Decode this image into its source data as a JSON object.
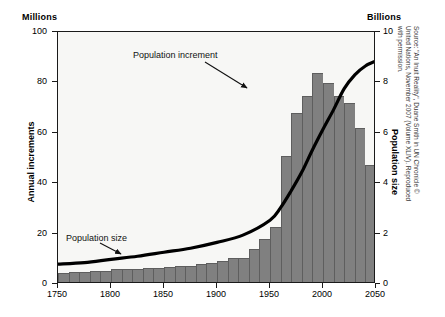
{
  "chart_data": {
    "type": "bar",
    "title": "",
    "subtitle": "",
    "xlabel": "",
    "ylabel": "Annual increments",
    "y2label": "Population size",
    "left_unit_caption": "Millions",
    "right_unit_caption": "Billions",
    "grid": false,
    "legend_position": "none",
    "xlim": [
      1750,
      2050
    ],
    "ylim": [
      0,
      100
    ],
    "y2lim": [
      0,
      10
    ],
    "xticks": [
      1750,
      1800,
      1850,
      1900,
      1950,
      2000,
      2050
    ],
    "xtick_labels": [
      "1750",
      "1800",
      "1850",
      "1900",
      "1950",
      "2000",
      "2050"
    ],
    "yticks": [
      0,
      20,
      40,
      60,
      80,
      100
    ],
    "ytick_labels": [
      "0",
      "20",
      "40",
      "60",
      "80",
      "100"
    ],
    "y2ticks": [
      0,
      2,
      4,
      6,
      8,
      10
    ],
    "y2tick_labels": [
      "0",
      "2",
      "4",
      "6",
      "8",
      "10"
    ],
    "bar_color": "#808080",
    "line_color": "#000000",
    "plot_background": "#f7f7f5",
    "bin_width_years": 10,
    "series": [
      {
        "name": "Population increment",
        "type": "bar",
        "axis": "left",
        "unit": "Millions",
        "x": [
          1750,
          1760,
          1770,
          1780,
          1790,
          1800,
          1810,
          1820,
          1830,
          1840,
          1850,
          1860,
          1870,
          1880,
          1890,
          1900,
          1910,
          1920,
          1930,
          1940,
          1950,
          1960,
          1970,
          1980,
          1990,
          2000,
          2010,
          2020,
          2030,
          2040
        ],
        "values": [
          3.5,
          4.0,
          4.0,
          4.2,
          4.5,
          5.0,
          5.0,
          5.2,
          5.5,
          5.5,
          6.0,
          6.2,
          6.5,
          7.0,
          7.5,
          8.5,
          9.5,
          9.5,
          13.0,
          17.0,
          22.0,
          50.0,
          67.0,
          74.0,
          83.0,
          79.0,
          74.0,
          71.0,
          61.0,
          46.5
        ]
      },
      {
        "name": "Population size",
        "type": "line",
        "axis": "right",
        "unit": "Billions",
        "x": [
          1750,
          1775,
          1800,
          1825,
          1850,
          1875,
          1900,
          1925,
          1950,
          1960,
          1970,
          1980,
          1990,
          2000,
          2010,
          2020,
          2030,
          2040,
          2050
        ],
        "values": [
          0.79,
          0.85,
          0.98,
          1.1,
          1.26,
          1.42,
          1.65,
          1.95,
          2.53,
          3.03,
          3.7,
          4.44,
          5.32,
          6.14,
          6.92,
          7.75,
          8.3,
          8.65,
          8.85
        ]
      }
    ],
    "annotations": [
      {
        "id": "population-increment",
        "text": "Population increment",
        "points_to_x": 1965,
        "points_to_y": 74
      },
      {
        "id": "population-size",
        "text": "Population size",
        "points_to_x": 1812,
        "points_to_y": 10
      }
    ]
  },
  "source": {
    "note": "Source: \"An Inuit Reality\", Duane Smith in UN Chronicle © United Nations, November 2007 (Volume XLIV). Reproduced with permission."
  }
}
